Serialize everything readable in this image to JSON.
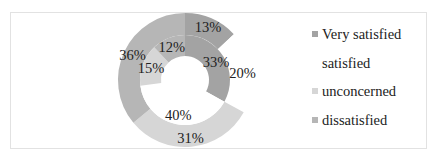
{
  "chart_data": {
    "type": "donut",
    "title": "",
    "categories": [
      "Very satisfied",
      "satisfied",
      "unconcerned",
      "dissatisfied"
    ],
    "series": [
      {
        "name": "outer ring",
        "values": [
          13,
          20,
          31,
          36
        ],
        "labels": [
          "13%",
          "20%",
          "31%",
          "36%"
        ]
      },
      {
        "name": "inner ring",
        "values": [
          33,
          40,
          15,
          12
        ],
        "labels": [
          "33%",
          "40%",
          "15%",
          "12%"
        ]
      }
    ],
    "colors": [
      "#a3a3a3",
      "#ffffff",
      "#d6d6d6",
      "#b6b6b6"
    ],
    "legend_position": "right",
    "start_angle_deg": 0,
    "direction": "clockwise"
  },
  "legend": {
    "items": [
      {
        "label": "Very satisfied",
        "color": "#a3a3a3"
      },
      {
        "label": "satisfied",
        "color": "#ffffff"
      },
      {
        "label": "unconcerned",
        "color": "#d6d6d6"
      },
      {
        "label": "dissatisfied",
        "color": "#b6b6b6"
      }
    ]
  }
}
